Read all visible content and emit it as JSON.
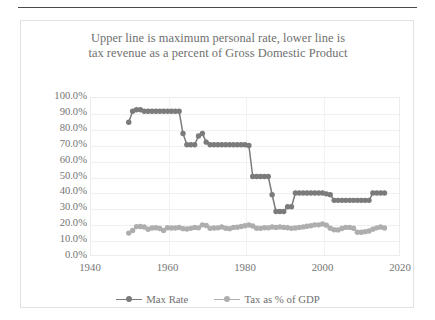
{
  "page": {
    "has_top_rule": true
  },
  "chart": {
    "title_line1": "Upper line is maximum personal rate, lower line is",
    "title_line2": "tax revenue as a percent of Gross Domestic Product",
    "colors": {
      "series_max_rate": "#7b7b7b",
      "series_tax_gdp": "#aeaeae",
      "grid": "#f0f0f0",
      "axis_text": "#757575",
      "title_text": "#6f6f6f",
      "plot_border": "#ececec",
      "frame_border": "#e2e2e2",
      "background": "#ffffff"
    }
  },
  "chart_data": {
    "type": "line",
    "title": "Upper line is maximum personal rate, lower line is tax revenue as a percent of Gross Domestic Product",
    "xlabel": "",
    "ylabel": "",
    "xlim": [
      1940,
      2020
    ],
    "ylim": [
      0,
      1.0
    ],
    "xticks": [
      1940,
      1960,
      1980,
      2000,
      2020
    ],
    "yticks": [
      0.0,
      0.1,
      0.2,
      0.3,
      0.4,
      0.5,
      0.6,
      0.7,
      0.8,
      0.9,
      1.0
    ],
    "ytick_labels": [
      "0.0%",
      "10.0%",
      "20.0%",
      "30.0%",
      "40.0%",
      "50.0%",
      "60.0%",
      "70.0%",
      "80.0%",
      "90.0%",
      "100.0%"
    ],
    "xtick_labels": [
      "1940",
      "1960",
      "1980",
      "2000",
      "2020"
    ],
    "grid": true,
    "legend_position": "bottom",
    "markers": true,
    "x": [
      1950,
      1951,
      1952,
      1953,
      1954,
      1955,
      1956,
      1957,
      1958,
      1959,
      1960,
      1961,
      1962,
      1963,
      1964,
      1965,
      1966,
      1967,
      1968,
      1969,
      1970,
      1971,
      1972,
      1973,
      1974,
      1975,
      1976,
      1977,
      1978,
      1979,
      1980,
      1981,
      1982,
      1983,
      1984,
      1985,
      1986,
      1987,
      1988,
      1989,
      1990,
      1991,
      1992,
      1993,
      1994,
      1995,
      1996,
      1997,
      1998,
      1999,
      2000,
      2001,
      2002,
      2003,
      2004,
      2005,
      2006,
      2007,
      2008,
      2009,
      2010,
      2011,
      2012,
      2013,
      2014,
      2015,
      2016
    ],
    "series": [
      {
        "name": "Max Rate",
        "color": "#7b7b7b",
        "values": [
          0.841,
          0.91,
          0.92,
          0.92,
          0.91,
          0.91,
          0.91,
          0.91,
          0.91,
          0.91,
          0.91,
          0.91,
          0.91,
          0.91,
          0.77,
          0.7,
          0.7,
          0.7,
          0.755,
          0.77,
          0.716,
          0.7,
          0.7,
          0.7,
          0.7,
          0.7,
          0.7,
          0.7,
          0.7,
          0.7,
          0.7,
          0.695,
          0.5,
          0.5,
          0.5,
          0.5,
          0.5,
          0.385,
          0.28,
          0.28,
          0.28,
          0.31,
          0.31,
          0.396,
          0.396,
          0.396,
          0.396,
          0.396,
          0.396,
          0.396,
          0.396,
          0.391,
          0.386,
          0.35,
          0.35,
          0.35,
          0.35,
          0.35,
          0.35,
          0.35,
          0.35,
          0.35,
          0.35,
          0.396,
          0.396,
          0.396,
          0.396
        ]
      },
      {
        "name": "Tax as % of GDP",
        "color": "#aeaeae",
        "values": [
          0.144,
          0.16,
          0.185,
          0.186,
          0.182,
          0.168,
          0.176,
          0.178,
          0.173,
          0.16,
          0.178,
          0.176,
          0.176,
          0.179,
          0.172,
          0.17,
          0.174,
          0.18,
          0.177,
          0.196,
          0.192,
          0.174,
          0.176,
          0.177,
          0.183,
          0.175,
          0.172,
          0.18,
          0.181,
          0.186,
          0.19,
          0.195,
          0.189,
          0.175,
          0.174,
          0.178,
          0.177,
          0.182,
          0.18,
          0.182,
          0.18,
          0.178,
          0.174,
          0.176,
          0.18,
          0.183,
          0.187,
          0.19,
          0.196,
          0.196,
          0.202,
          0.194,
          0.175,
          0.165,
          0.164,
          0.173,
          0.18,
          0.18,
          0.175,
          0.149,
          0.149,
          0.153,
          0.157,
          0.169,
          0.177,
          0.182,
          0.176
        ]
      }
    ]
  },
  "legend": {
    "items": [
      {
        "label": "Max Rate",
        "color": "#7b7b7b"
      },
      {
        "label": "Tax as % of GDP",
        "color": "#aeaeae"
      }
    ]
  }
}
